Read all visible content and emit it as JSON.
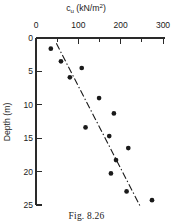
{
  "figure": {
    "caption": "Fig. 8.26"
  },
  "chart_data": {
    "type": "scatter",
    "title": "",
    "xlabel_main": "c",
    "xlabel_sub": "u",
    "xlabel_units": " (kN/m",
    "xlabel_sup": "2",
    "xlabel_close": ")",
    "xlabel": "cu (kN/m2)",
    "ylabel": "Depth (m)",
    "x_axis_position": "top",
    "y_axis_direction": "inverted",
    "xlim": [
      0,
      300
    ],
    "ylim": [
      0,
      25
    ],
    "x_ticks": [
      0,
      100,
      200,
      300
    ],
    "x_tick_labels": [
      "0",
      "100",
      "200",
      "300"
    ],
    "x_minor_ticks": [
      50,
      150,
      250
    ],
    "y_ticks": [
      0,
      5,
      10,
      15,
      20,
      25
    ],
    "y_tick_labels": [
      "0",
      "5",
      "10",
      "15",
      "20",
      "25"
    ],
    "grid": false,
    "legend": null,
    "x": [
      35,
      59,
      108,
      80,
      149,
      184,
      117,
      173,
      218,
      189,
      177,
      214,
      274
    ],
    "y": [
      1.6,
      3.5,
      4.5,
      5.9,
      9.0,
      11.3,
      13.4,
      14.7,
      16.5,
      18.3,
      20.3,
      23.0,
      24.3
    ],
    "points": [
      {
        "cu": 35,
        "depth": 1.6
      },
      {
        "cu": 59,
        "depth": 3.5
      },
      {
        "cu": 108,
        "depth": 4.5
      },
      {
        "cu": 80,
        "depth": 5.9
      },
      {
        "cu": 149,
        "depth": 9.0
      },
      {
        "cu": 184,
        "depth": 11.3
      },
      {
        "cu": 117,
        "depth": 13.4
      },
      {
        "cu": 173,
        "depth": 14.7
      },
      {
        "cu": 218,
        "depth": 16.5
      },
      {
        "cu": 189,
        "depth": 18.3
      },
      {
        "cu": 177,
        "depth": 20.3
      },
      {
        "cu": 214,
        "depth": 23.0
      },
      {
        "cu": 274,
        "depth": 24.3
      }
    ],
    "trend_line": {
      "style": "dash-dot",
      "from": {
        "cu": 48,
        "depth": 0.8
      },
      "to": {
        "cu": 246,
        "depth": 25.2
      }
    }
  }
}
